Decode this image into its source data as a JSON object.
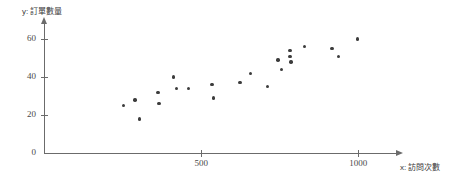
{
  "chart_data": {
    "type": "scatter",
    "title": "",
    "xlabel": "x: 訪問次數",
    "ylabel": "y: 訂單數量",
    "xlim": [
      0,
      1120
    ],
    "ylim": [
      0,
      68
    ],
    "grid": false,
    "legend": null,
    "xticks": [
      {
        "value": 500,
        "label": "500"
      },
      {
        "value": 1000,
        "label": "1000"
      }
    ],
    "yticks": [
      {
        "value": 0,
        "label": "0"
      },
      {
        "value": 20,
        "label": "20"
      },
      {
        "value": 40,
        "label": "40"
      },
      {
        "value": 60,
        "label": "60"
      }
    ],
    "points": [
      {
        "x": 252,
        "y": 25
      },
      {
        "x": 289,
        "y": 28
      },
      {
        "x": 304,
        "y": 18
      },
      {
        "x": 363,
        "y": 32
      },
      {
        "x": 366,
        "y": 26
      },
      {
        "x": 413,
        "y": 40
      },
      {
        "x": 422,
        "y": 34
      },
      {
        "x": 460,
        "y": 34
      },
      {
        "x": 534,
        "y": 36
      },
      {
        "x": 540,
        "y": 29
      },
      {
        "x": 624,
        "y": 37
      },
      {
        "x": 658,
        "y": 42
      },
      {
        "x": 711,
        "y": 35
      },
      {
        "x": 745,
        "y": 49
      },
      {
        "x": 755,
        "y": 44
      },
      {
        "x": 783,
        "y": 54
      },
      {
        "x": 783,
        "y": 51
      },
      {
        "x": 786,
        "y": 48
      },
      {
        "x": 829,
        "y": 56
      },
      {
        "x": 916,
        "y": 55
      },
      {
        "x": 938,
        "y": 51
      },
      {
        "x": 997,
        "y": 60
      }
    ]
  },
  "axis": {
    "x_title": "x: 訪問次數",
    "y_title": "y: 訂單數量"
  }
}
